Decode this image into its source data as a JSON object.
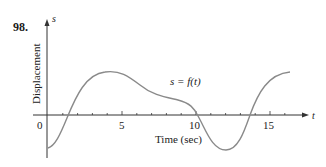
{
  "problem_number": "98.",
  "chart_data": {
    "type": "line",
    "title": "",
    "xlabel": "Time (sec)",
    "ylabel": "Displacement",
    "x_axis_name": "t",
    "y_axis_name": "s",
    "curve_label": "s = f(t)",
    "x_tick_labels": [
      "0",
      "5",
      "10",
      "15"
    ],
    "x_tick_label_values": [
      0,
      5,
      10,
      15
    ],
    "minor_tick_spacing": 1,
    "xlim": [
      0,
      17
    ],
    "grid": false,
    "x": [
      0,
      0.5,
      1,
      1.3,
      2,
      3,
      4,
      5,
      6,
      7,
      8,
      9,
      10,
      11,
      12,
      13,
      13.6,
      14,
      15,
      16
    ],
    "y": [
      -2.2,
      -1.8,
      -0.8,
      0,
      1.5,
      2.6,
      2.9,
      2.7,
      1.9,
      1.3,
      1.1,
      0.8,
      0,
      -1.6,
      -2.3,
      -1.2,
      0,
      0.9,
      2.3,
      2.8
    ],
    "colors": {
      "curve": "#8a8a8a",
      "axes": "#333333"
    }
  }
}
